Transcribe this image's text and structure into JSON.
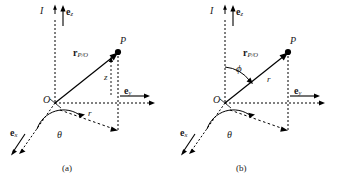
{
  "figure": {
    "type": "vector-diagram",
    "background": "#ffffff",
    "stroke": "#000000",
    "panels": [
      {
        "id": "a",
        "caption": "(a)",
        "coordinate_system": "cylindrical",
        "labels": {
          "frame": "I",
          "origin": "O",
          "point": "P",
          "unit_z": "e",
          "unit_z_sub": "z",
          "unit_y": "e",
          "unit_y_sub": "y",
          "unit_x": "e",
          "unit_x_sub": "x",
          "position_vector": "r",
          "position_vector_sub": "P/O",
          "angle_theta": "θ",
          "radial": "r",
          "height": "z"
        }
      },
      {
        "id": "b",
        "caption": "(b)",
        "coordinate_system": "spherical",
        "labels": {
          "frame": "I",
          "origin": "O",
          "point": "P",
          "unit_z": "e",
          "unit_z_sub": "z",
          "unit_y": "e",
          "unit_y_sub": "y",
          "unit_x": "e",
          "unit_x_sub": "x",
          "position_vector": "r",
          "position_vector_sub": "P/O",
          "angle_theta": "θ",
          "angle_phi": "ϕ",
          "radial": "r"
        }
      }
    ]
  }
}
